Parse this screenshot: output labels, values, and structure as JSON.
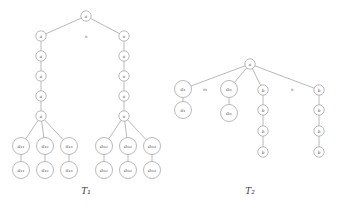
{
  "figure": {
    "background_color": "#ffffff",
    "stroke_color": "#8a8a8a",
    "text_color": "#4a4a4a"
  },
  "trees": [
    {
      "id": "T1",
      "caption": "T₁",
      "caption_x": 86,
      "caption_y": 191,
      "root": {
        "label": "a",
        "x": 86,
        "y": 16,
        "r": 5.2,
        "font": 4.2
      },
      "edge_labels": [
        {
          "text": "n",
          "x": 86,
          "y": 36
        }
      ],
      "branches": [
        {
          "id": "left",
          "chain": [
            {
              "label": "a",
              "x": 41,
              "y": 36,
              "r": 5.2,
              "font": 4.2
            },
            {
              "label": "a",
              "x": 41,
              "y": 56,
              "r": 5.2,
              "font": 4.2
            },
            {
              "label": "a",
              "x": 41,
              "y": 76,
              "r": 5.2,
              "font": 4.2
            },
            {
              "label": "a",
              "x": 41,
              "y": 96,
              "r": 5.2,
              "font": 4.2
            },
            {
              "label": "a",
              "x": 41,
              "y": 116,
              "r": 5.2,
              "font": 4.2
            }
          ],
          "leaves": [
            {
              "top": {
                "label": "a₁₁",
                "x": 21,
                "y": 146,
                "r": 8.5,
                "font": 5
              },
              "bottom": {
                "label": "a₁₁",
                "x": 21,
                "y": 170,
                "r": 8.5,
                "font": 5
              }
            },
            {
              "top": {
                "label": "a₁₂",
                "x": 45,
                "y": 146,
                "r": 8.5,
                "font": 5
              },
              "bottom": {
                "label": "a₁₂",
                "x": 45,
                "y": 170,
                "r": 8.5,
                "font": 5
              }
            },
            {
              "top": {
                "label": "a₁₃",
                "x": 69,
                "y": 146,
                "r": 8.5,
                "font": 5
              },
              "bottom": {
                "label": "a₁₃",
                "x": 69,
                "y": 170,
                "r": 8.5,
                "font": 5
              }
            }
          ]
        },
        {
          "id": "right",
          "chain": [
            {
              "label": "a",
              "x": 124,
              "y": 36,
              "r": 5.2,
              "font": 4.2
            },
            {
              "label": "a",
              "x": 124,
              "y": 56,
              "r": 5.2,
              "font": 4.2
            },
            {
              "label": "a",
              "x": 124,
              "y": 76,
              "r": 5.2,
              "font": 4.2
            },
            {
              "label": "a",
              "x": 124,
              "y": 96,
              "r": 5.2,
              "font": 4.2
            },
            {
              "label": "a",
              "x": 124,
              "y": 116,
              "r": 5.2,
              "font": 4.2
            }
          ],
          "leaves": [
            {
              "top": {
                "label": "aₘ₁",
                "x": 104,
                "y": 146,
                "r": 8.5,
                "font": 5
              },
              "bottom": {
                "label": "aₘ₁",
                "x": 104,
                "y": 170,
                "r": 8.5,
                "font": 5
              }
            },
            {
              "top": {
                "label": "aₘ₂",
                "x": 128,
                "y": 146,
                "r": 8.5,
                "font": 5
              },
              "bottom": {
                "label": "aₘ₂",
                "x": 128,
                "y": 170,
                "r": 8.5,
                "font": 5
              }
            },
            {
              "top": {
                "label": "aₘ₃",
                "x": 152,
                "y": 146,
                "r": 8.5,
                "font": 5
              },
              "bottom": {
                "label": "aₘ₃",
                "x": 152,
                "y": 170,
                "r": 8.5,
                "font": 5
              }
            }
          ]
        }
      ]
    },
    {
      "id": "T2",
      "caption": "T₂",
      "caption_x": 250,
      "caption_y": 191,
      "root": {
        "label": "a",
        "x": 250,
        "y": 64,
        "r": 5.2,
        "font": 4.2
      },
      "edge_labels": [
        {
          "text": "m",
          "x": 205,
          "y": 89
        },
        {
          "text": "n",
          "x": 292,
          "y": 89
        }
      ],
      "subtrees": [
        {
          "id": "a1",
          "nodes": [
            {
              "label": "a₁",
              "x": 183,
              "y": 89,
              "r": 8.5,
              "font": 5
            },
            {
              "label": "a₁",
              "x": 183,
              "y": 110,
              "r": 8.5,
              "font": 5
            }
          ]
        },
        {
          "id": "am",
          "nodes": [
            {
              "label": "aₘ",
              "x": 229,
              "y": 89,
              "r": 8.5,
              "font": 5
            },
            {
              "label": "aₘ",
              "x": 229,
              "y": 113,
              "r": 8.5,
              "font": 5
            }
          ]
        },
        {
          "id": "b-chain-left",
          "nodes": [
            {
              "label": "b",
              "x": 263,
              "y": 90,
              "r": 5.2,
              "font": 4.2
            },
            {
              "label": "b",
              "x": 263,
              "y": 110,
              "r": 5.2,
              "font": 4.2
            },
            {
              "label": "b",
              "x": 263,
              "y": 131,
              "r": 5.2,
              "font": 4.2
            },
            {
              "label": "b",
              "x": 263,
              "y": 152,
              "r": 5.2,
              "font": 4.2
            }
          ]
        },
        {
          "id": "b-chain-right",
          "nodes": [
            {
              "label": "b",
              "x": 319,
              "y": 90,
              "r": 5.2,
              "font": 4.2
            },
            {
              "label": "b",
              "x": 319,
              "y": 110,
              "r": 5.2,
              "font": 4.2
            },
            {
              "label": "b",
              "x": 319,
              "y": 131,
              "r": 5.2,
              "font": 4.2
            },
            {
              "label": "b",
              "x": 319,
              "y": 152,
              "r": 5.2,
              "font": 4.2
            }
          ]
        }
      ]
    }
  ]
}
